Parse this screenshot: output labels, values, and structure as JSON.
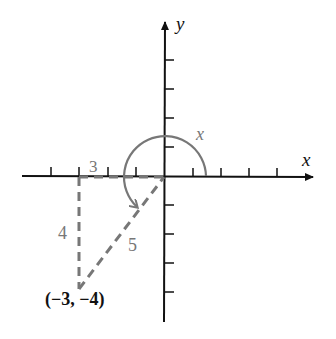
{
  "diagram": {
    "axes": {
      "x_label": "x",
      "y_label": "y"
    },
    "angle_label": "x",
    "point_label": "(−3, −4)",
    "triangle": {
      "horizontal_leg_label": "3",
      "vertical_leg_label": "4",
      "hypotenuse_label": "5"
    },
    "colors": {
      "axis": "#111111",
      "construction": "#777777",
      "text": "#111111"
    }
  }
}
